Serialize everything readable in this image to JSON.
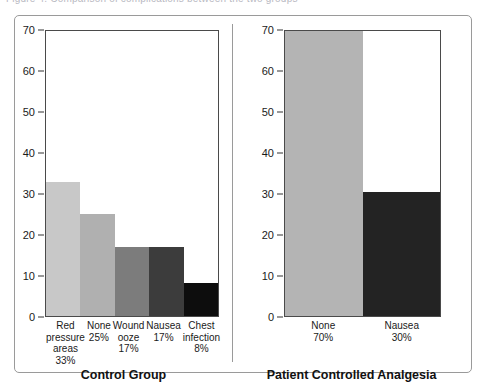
{
  "caption": {
    "text": "Figure 4. Comparison of complications between the two groups"
  },
  "panels": [
    {
      "name": "control-group",
      "title": "Control Group",
      "y_ticks": [
        0,
        10,
        20,
        30,
        40,
        50,
        60,
        70
      ],
      "categories": [
        {
          "lines": [
            "Red",
            "pressure",
            "areas",
            "33%"
          ]
        },
        {
          "lines": [
            "None",
            "25%"
          ]
        },
        {
          "lines": [
            "Wound",
            "ooze",
            "17%"
          ]
        },
        {
          "lines": [
            "Nausea",
            "17%"
          ]
        },
        {
          "lines": [
            "Chest",
            "infection",
            "8%"
          ]
        }
      ],
      "values": [
        33,
        25,
        17,
        17,
        8
      ],
      "colors": [
        "#c8c8c8",
        "#b0b0b0",
        "#7c7c7c",
        "#3c3c3c",
        "#0d0d0d"
      ]
    },
    {
      "name": "patient-controlled-analgesia",
      "title": "Patient Controlled Analgesia",
      "y_ticks": [
        0,
        10,
        20,
        30,
        40,
        50,
        60,
        70
      ],
      "categories": [
        {
          "lines": [
            "None",
            "70%"
          ]
        },
        {
          "lines": [
            "Nausea",
            "30%"
          ]
        }
      ],
      "values": [
        70,
        30.5
      ],
      "colors": [
        "#b4b4b4",
        "#232323"
      ]
    }
  ],
  "chart_data": {
    "type": "bar",
    "title": "",
    "subtitle": "",
    "xlabel": "",
    "ylabel": "",
    "ylim": [
      0,
      70
    ],
    "yticks": [
      0,
      10,
      20,
      30,
      40,
      50,
      60,
      70
    ],
    "grid": false,
    "legend": "none",
    "panels": [
      {
        "panel_title": "Control Group",
        "categories": [
          "Red pressure areas",
          "None",
          "Wound ooze",
          "Nausea",
          "Chest infection"
        ],
        "category_labels": [
          "Red pressure areas 33%",
          "None 25%",
          "Wound ooze 17%",
          "Nausea 17%",
          "Chest infection 8%"
        ],
        "values": [
          33,
          25,
          17,
          17,
          8
        ],
        "value_labels": [
          "33%",
          "25%",
          "17%",
          "17%",
          "8%"
        ],
        "colors": [
          "#c8c8c8",
          "#b0b0b0",
          "#7c7c7c",
          "#3c3c3c",
          "#0d0d0d"
        ]
      },
      {
        "panel_title": "Patient Controlled Analgesia",
        "categories": [
          "None",
          "Nausea"
        ],
        "category_labels": [
          "None 70%",
          "Nausea 30%"
        ],
        "values": [
          70,
          30.5
        ],
        "value_labels": [
          "70%",
          "30%"
        ],
        "colors": [
          "#b4b4b4",
          "#232323"
        ]
      }
    ]
  }
}
